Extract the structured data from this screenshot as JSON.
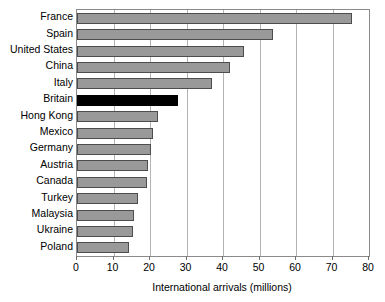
{
  "chart_data": {
    "type": "bar",
    "orientation": "horizontal",
    "title": "",
    "subtitle": "",
    "xlabel": "International arrivals (millions)",
    "ylabel": "",
    "xlim": [
      0,
      80
    ],
    "xticks": [
      0,
      10,
      20,
      30,
      40,
      50,
      60,
      70,
      80
    ],
    "xtick_labels": [
      "0",
      "10",
      "20",
      "30",
      "40",
      "50",
      "60",
      "70",
      "80"
    ],
    "grid": "vertical",
    "legend": "none",
    "categories": [
      "France",
      "Spain",
      "United States",
      "China",
      "Italy",
      "Britain",
      "Hong Kong",
      "Mexico",
      "Germany",
      "Austria",
      "Canada",
      "Turkey",
      "Malaysia",
      "Ukraine",
      "Poland"
    ],
    "values": [
      75.3,
      53.6,
      45.8,
      41.9,
      37.0,
      27.8,
      22.1,
      20.8,
      20.3,
      19.4,
      19.2,
      16.8,
      15.5,
      15.4,
      14.3
    ],
    "highlighted_category": "Britain",
    "colors": {
      "bar": "#999999",
      "bar_highlight": "#000000",
      "bar_border": "#4d4d4d",
      "gridline": "#b4b4b4",
      "frame": "#8a8a8a",
      "text": "#000000",
      "background": "#ffffff"
    }
  }
}
